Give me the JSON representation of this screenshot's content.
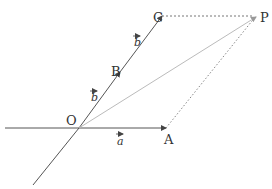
{
  "diagram": {
    "type": "vector-parallelogram",
    "points": {
      "O": {
        "label": "O",
        "x": 79,
        "y": 128
      },
      "A": {
        "label": "A",
        "x": 166,
        "y": 128
      },
      "B": {
        "label": "B",
        "x": 120,
        "y": 72
      },
      "C": {
        "label": "C",
        "x": 162,
        "y": 16
      },
      "P": {
        "label": "P",
        "x": 256,
        "y": 16
      }
    },
    "vectors": [
      {
        "name": "a",
        "label": "a",
        "from": "O",
        "to": "A"
      },
      {
        "name": "b1",
        "label": "b",
        "from": "O",
        "to": "B"
      },
      {
        "name": "b2",
        "label": "b",
        "from": "B",
        "to": "C"
      }
    ],
    "colors": {
      "line": "#555555",
      "dotted": "#777777",
      "diagonal": "#bbbbbb",
      "text": "#333333"
    }
  }
}
